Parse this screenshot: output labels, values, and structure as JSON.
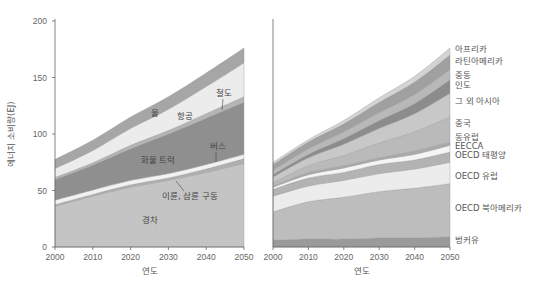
{
  "chart_data": [
    {
      "type": "area",
      "stacked": true,
      "title": "",
      "xlabel": "연도",
      "ylabel": "에너지 소비량(EJ)",
      "x": [
        2000,
        2010,
        2020,
        2030,
        2040,
        2050
      ],
      "xticks": [
        "2000",
        "2010",
        "2020",
        "2030",
        "2040",
        "2050"
      ],
      "yticks": [
        "0",
        "50",
        "100",
        "150",
        "200"
      ],
      "ylim": [
        0,
        200
      ],
      "grid": false,
      "series": [
        {
          "name": "경차",
          "color": "#c4c4c4",
          "values": [
            36,
            45,
            53,
            59,
            66,
            74
          ]
        },
        {
          "name": "이륜, 삼륜 구동",
          "color": "#b0b0b0",
          "values": [
            1.5,
            1.5,
            2,
            2,
            3,
            4
          ]
        },
        {
          "name": "버스",
          "color": "#f2f2f2",
          "values": [
            4,
            4,
            4,
            4,
            4,
            4
          ]
        },
        {
          "name": "화물 트럭",
          "color": "#8f8f8f",
          "values": [
            18,
            22,
            28,
            35,
            41,
            46
          ]
        },
        {
          "name": "철도",
          "color": "#b5b5b5",
          "values": [
            2,
            2,
            3,
            3,
            4,
            5
          ]
        },
        {
          "name": "항공",
          "color": "#ececec",
          "values": [
            8,
            11,
            15,
            19,
            24,
            30
          ]
        },
        {
          "name": "물",
          "color": "#a6a6a6",
          "values": [
            8,
            9,
            10,
            11,
            12,
            13
          ]
        }
      ],
      "annotations": [
        {
          "text": "물"
        },
        {
          "text": "항공"
        },
        {
          "text": "철도"
        },
        {
          "text": "버스"
        },
        {
          "text": "화물 트럭"
        },
        {
          "text": "이륜, 삼륜 구동"
        },
        {
          "text": "경차"
        }
      ]
    },
    {
      "type": "area",
      "stacked": true,
      "title": "",
      "xlabel": "연도",
      "ylabel": "",
      "x": [
        2000,
        2010,
        2020,
        2030,
        2040,
        2050
      ],
      "xticks": [
        "2000",
        "2010",
        "2020",
        "2030",
        "2040",
        "2050"
      ],
      "ylim": [
        0,
        200
      ],
      "grid": false,
      "legend_position": "right",
      "series": [
        {
          "name": "벙커유",
          "color": "#9a9a9a",
          "values": [
            6,
            7,
            7,
            8,
            8,
            9
          ]
        },
        {
          "name": "OECD 북아메리카",
          "color": "#bdbdbd",
          "values": [
            25,
            33,
            37,
            41,
            44,
            47
          ]
        },
        {
          "name": "OECD 유럽",
          "color": "#ececec",
          "values": [
            14,
            14,
            15,
            16,
            17,
            19
          ]
        },
        {
          "name": "OECD 태평양",
          "color": "#b3b3b3",
          "values": [
            6,
            7,
            7,
            8,
            8,
            9
          ]
        },
        {
          "name": "EECCA",
          "color": "#f5f5f5",
          "values": [
            2,
            3,
            4,
            4,
            5,
            6
          ]
        },
        {
          "name": "동유럽",
          "color": "#a9a9a9",
          "values": [
            1,
            2,
            2,
            2,
            3,
            3
          ]
        },
        {
          "name": "중국",
          "color": "#bababa",
          "values": [
            3,
            6,
            9,
            13,
            17,
            22
          ]
        },
        {
          "name": "그 외 아시아",
          "color": "#c8c8c8",
          "values": [
            5,
            7,
            10,
            13,
            16,
            21
          ]
        },
        {
          "name": "인도",
          "color": "#8c8c8c",
          "values": [
            2,
            3,
            5,
            7,
            9,
            12
          ]
        },
        {
          "name": "중동",
          "color": "#b8b8b8",
          "values": [
            4,
            5,
            6,
            7,
            8,
            9
          ]
        },
        {
          "name": "라틴아메리카",
          "color": "#a0a0a0",
          "values": [
            5,
            6,
            7,
            9,
            11,
            13
          ]
        },
        {
          "name": "아프리카",
          "color": "#d4d4d4",
          "values": [
            2,
            2,
            3,
            4,
            5,
            6
          ]
        }
      ]
    }
  ]
}
